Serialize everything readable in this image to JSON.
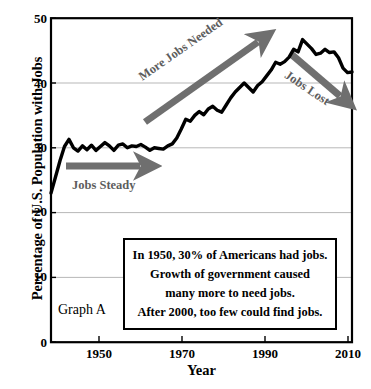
{
  "chart_data": {
    "type": "line",
    "title": "",
    "xlabel": "Year",
    "ylabel": "Percentage of U.S. Population with Jobs",
    "xlim": [
      1944,
      2011
    ],
    "ylim": [
      0,
      50
    ],
    "xticks": [
      "1950",
      "1970",
      "1990",
      "2010"
    ],
    "xtick_values": [
      1950,
      1970,
      1990,
      2010
    ],
    "yticks": [
      "0",
      "10",
      "20",
      "30",
      "40",
      "50"
    ],
    "ytick_values": [
      0,
      10,
      20,
      30,
      40,
      50
    ],
    "grid": "horizontal",
    "legend": "none",
    "line_color": "#000000",
    "series": [
      {
        "name": "Percentage of U.S. Population with Jobs",
        "x": [
          1944,
          1945,
          1946,
          1947,
          1948,
          1949,
          1950,
          1951,
          1952,
          1953,
          1954,
          1955,
          1956,
          1957,
          1958,
          1959,
          1960,
          1961,
          1962,
          1963,
          1964,
          1965,
          1966,
          1967,
          1968,
          1969,
          1970,
          1971,
          1972,
          1973,
          1974,
          1975,
          1976,
          1977,
          1978,
          1979,
          1980,
          1981,
          1982,
          1983,
          1984,
          1985,
          1986,
          1987,
          1988,
          1989,
          1990,
          1991,
          1992,
          1993,
          1994,
          1995,
          1996,
          1997,
          1998,
          1999,
          2000,
          2001,
          2002,
          2003,
          2004,
          2005,
          2006,
          2007,
          2008,
          2009,
          2010,
          2011
        ],
        "values": [
          23.0,
          25.5,
          28.0,
          30.2,
          31.3,
          30.0,
          29.5,
          30.3,
          29.7,
          30.4,
          29.6,
          30.2,
          30.8,
          30.3,
          29.6,
          30.4,
          30.6,
          30.0,
          30.3,
          30.2,
          30.5,
          30.1,
          29.6,
          30.0,
          29.9,
          29.8,
          30.3,
          30.6,
          31.5,
          32.9,
          34.4,
          34.1,
          35.0,
          35.6,
          35.1,
          36.0,
          36.4,
          35.8,
          35.5,
          36.6,
          37.7,
          38.6,
          39.3,
          40.0,
          39.3,
          38.6,
          39.6,
          40.2,
          41.1,
          42.0,
          43.2,
          42.9,
          43.3,
          44.0,
          45.2,
          44.8,
          46.7,
          46.0,
          45.3,
          44.4,
          44.6,
          45.2,
          44.7,
          44.8,
          43.9,
          42.3,
          41.6,
          41.7
        ]
      }
    ],
    "annotations": [
      {
        "name": "jobs-steady",
        "text": "Jobs Steady",
        "arrow": "right",
        "color": "#6f6f6f"
      },
      {
        "name": "more-jobs-needed",
        "text": "More Jobs Needed",
        "arrow": "up-right",
        "color": "#6f6f6f"
      },
      {
        "name": "jobs-lost",
        "text": "Jobs Lost",
        "arrow": "down-right",
        "color": "#6f6f6f"
      }
    ],
    "callout_lines": [
      "In 1950, 30% of Americans had jobs.",
      "Growth of government caused",
      "many more to need jobs.",
      "After 2000, too few could find jobs."
    ],
    "graph_caption": "Graph A"
  }
}
